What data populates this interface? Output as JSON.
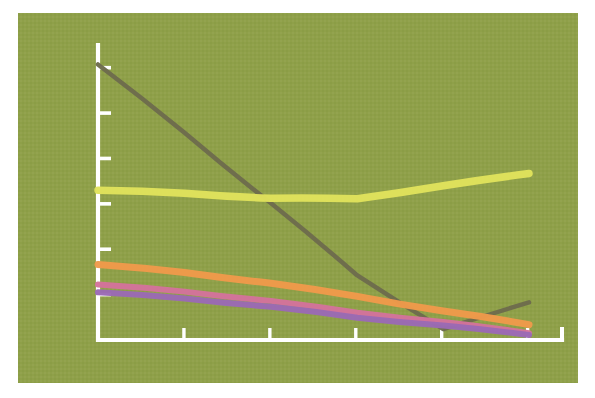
{
  "figure": {
    "name": "line-chart-figure",
    "background_color": "#8fa049",
    "paper_color": "#ffffff",
    "axis_color": "#ffffff",
    "plot_area": {
      "left": 18,
      "top": 13,
      "width": 560,
      "height": 370
    }
  },
  "chart_data": {
    "type": "line",
    "title": "",
    "subtitle": "",
    "xlabel": "",
    "ylabel": "",
    "grid": false,
    "legend": "none",
    "x": [
      0,
      1,
      2,
      3,
      4,
      5
    ],
    "xlim": [
      0,
      5.4
    ],
    "ylim": [
      0,
      6.5
    ],
    "x_tick_labels": [
      "",
      "",
      "",
      "",
      "",
      ""
    ],
    "y_tick_labels": [
      "",
      "",
      "",
      "",
      "",
      ""
    ],
    "y_ticks": [
      1,
      2,
      3,
      4,
      5,
      6
    ],
    "x_ticks": [
      0,
      1,
      2,
      3,
      4,
      5
    ],
    "series": [
      {
        "name": "dark-olive-series",
        "color": "#6e6c4e",
        "width": 4.5,
        "values": [
          6.1,
          4.55,
          3.0,
          1.45,
          0.22,
          0.82
        ]
      },
      {
        "name": "yellow-series",
        "color": "#e1e35c",
        "width": 7.5,
        "values": [
          3.33,
          3.22,
          3.11,
          3.14,
          3.38,
          3.66
        ]
      },
      {
        "name": "orange-series",
        "color": "#f09a4b",
        "width": 7.0,
        "values": [
          1.69,
          1.47,
          1.24,
          0.99,
          0.62,
          0.33
        ]
      },
      {
        "name": "pink-series",
        "color": "#d4739c",
        "width": 6.0,
        "values": [
          1.25,
          1.05,
          0.85,
          0.63,
          0.38,
          0.14
        ]
      },
      {
        "name": "purple-series",
        "color": "#9b6bb5",
        "width": 6.0,
        "values": [
          1.08,
          0.9,
          0.72,
          0.52,
          0.3,
          0.1
        ]
      }
    ]
  }
}
